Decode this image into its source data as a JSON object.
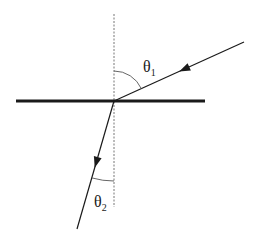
{
  "diagram": {
    "type": "refraction",
    "colors": {
      "stroke": "#1a1a1a",
      "normal": "#777777",
      "arc": "#555555",
      "background": "#ffffff"
    },
    "interface": {
      "x1": 16,
      "y1": 101,
      "x2": 205,
      "y2": 101,
      "width": 3
    },
    "normal": {
      "x": 114,
      "y1": 14,
      "y2": 207
    },
    "incident_ray": {
      "x1": 244,
      "y1": 42,
      "x2": 114,
      "y2": 101
    },
    "refracted_ray": {
      "x1": 114,
      "y1": 101,
      "x2": 77,
      "y2": 229
    },
    "labels": {
      "theta1": {
        "symbol": "θ",
        "subscript": "1",
        "x": 143,
        "y": 72
      },
      "theta2": {
        "symbol": "θ",
        "subscript": "2",
        "x": 94,
        "y": 207
      }
    }
  }
}
